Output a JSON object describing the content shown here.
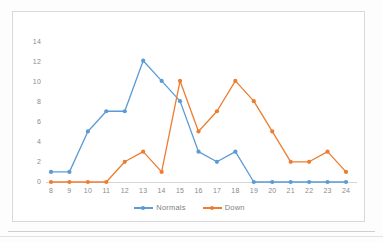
{
  "chart_data": {
    "type": "line",
    "title": "",
    "xlabel": "",
    "ylabel": "",
    "x": [
      8,
      9,
      10,
      11,
      12,
      13,
      14,
      15,
      16,
      17,
      18,
      19,
      20,
      21,
      22,
      23,
      24
    ],
    "xticklabels": [
      "8",
      "9",
      "10",
      "11",
      "12",
      "13",
      "14",
      "15",
      "16",
      "17",
      "18",
      "19",
      "20",
      "21",
      "22",
      "23",
      "24"
    ],
    "yticklabels": [
      "0",
      "2",
      "4",
      "6",
      "8",
      "10",
      "12",
      "14"
    ],
    "yticks": [
      0,
      2,
      4,
      6,
      8,
      10,
      12,
      14
    ],
    "ylim": [
      0,
      14
    ],
    "xlim": [
      8,
      24
    ],
    "grid": false,
    "legend_position": "bottom-center",
    "series": [
      {
        "name": "Normals",
        "color": "#5B9BD5",
        "marker": "circle",
        "values": [
          1,
          1,
          5,
          7,
          7,
          12,
          10,
          8,
          3,
          2,
          3,
          0,
          0,
          0,
          0,
          0,
          0
        ]
      },
      {
        "name": "Down",
        "color": "#ED7D31",
        "marker": "circle",
        "values": [
          0,
          0,
          0,
          0,
          2,
          3,
          1,
          10,
          5,
          7,
          10,
          8,
          5,
          2,
          2,
          3,
          1
        ]
      }
    ]
  },
  "legend": {
    "items": [
      {
        "label": "Normals"
      },
      {
        "label": "Down"
      }
    ]
  },
  "colors": {
    "normals": "#5B9BD5",
    "down": "#ED7D31",
    "axis": "#d6d6d6",
    "tick_text": "#8a8a8a",
    "frame_border": "#d9d9d9"
  }
}
